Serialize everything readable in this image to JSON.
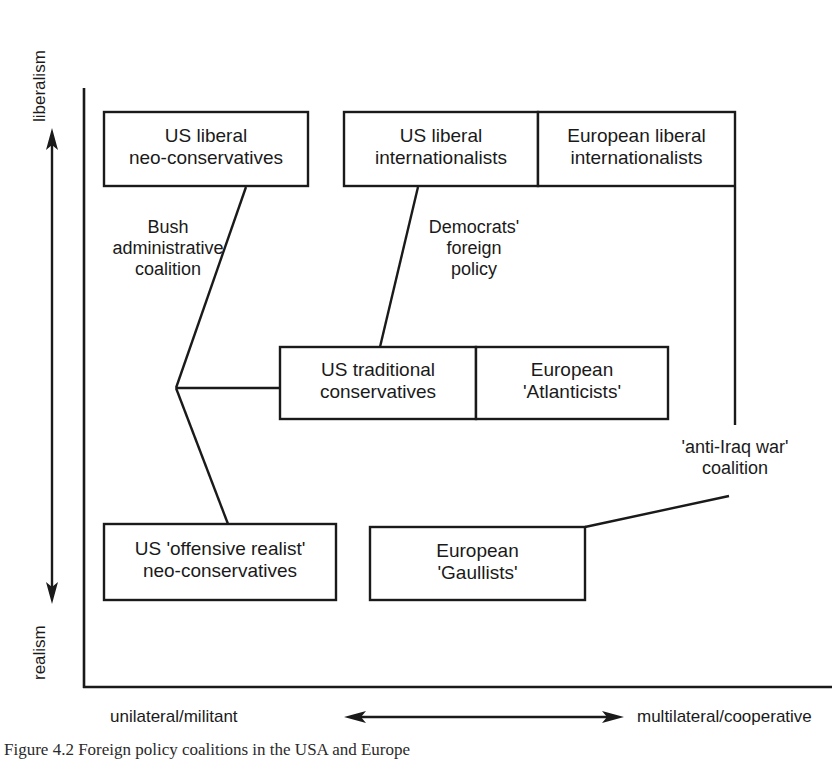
{
  "figure": {
    "caption": "Figure 4.2  Foreign policy coalitions in the USA and Europe",
    "stroke_color": "#1a1a1a",
    "background_color": "#ffffff"
  },
  "axes": {
    "vertical": {
      "top_label": "liberalism",
      "bottom_label": "realism"
    },
    "horizontal": {
      "left_label": "unilateral/militant",
      "right_label": "multilateral/cooperative"
    }
  },
  "boxes": [
    {
      "id": "us-liberal-neo-conservatives",
      "text": "US liberal\nneo-conservatives",
      "x": 104,
      "y": 112,
      "w": 204,
      "h": 74
    },
    {
      "id": "us-liberal-internationalists",
      "text": "US liberal\ninternationalists",
      "x": 344,
      "y": 112,
      "w": 194,
      "h": 74
    },
    {
      "id": "european-liberal-internationalists",
      "text": "European liberal\ninternationalists",
      "x": 538,
      "y": 112,
      "w": 197,
      "h": 74
    },
    {
      "id": "us-traditional-conservatives",
      "text": "US traditional\nconservatives",
      "x": 280,
      "y": 347,
      "w": 196,
      "h": 72
    },
    {
      "id": "european-atlanticists",
      "text": "European\n'Atlanticists'",
      "x": 476,
      "y": 347,
      "w": 192,
      "h": 72
    },
    {
      "id": "us-offensive-realist-neo-conservatives",
      "text": "US 'offensive realist'\nneo-conservatives",
      "x": 104,
      "y": 524,
      "w": 232,
      "h": 76
    },
    {
      "id": "european-gaullists",
      "text": "European\n'Gaullists'",
      "x": 370,
      "y": 527,
      "w": 215,
      "h": 73
    }
  ],
  "connector_labels": [
    {
      "id": "bush-administrative-coalition",
      "text": "Bush\nadministrative\ncoalition",
      "cx": 168,
      "y": 217
    },
    {
      "id": "democrats-foreign-policy",
      "text": "Democrats'\nforeign\npolicy",
      "cx": 474,
      "y": 217
    },
    {
      "id": "anti-iraq-war-coalition",
      "text": "'anti-Iraq war'\ncoalition",
      "cx": 735,
      "y": 437
    }
  ]
}
